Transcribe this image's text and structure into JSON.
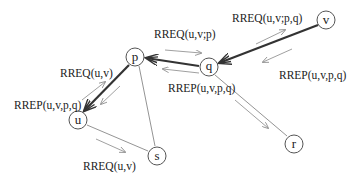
{
  "diagram": {
    "nodes": [
      {
        "id": "p",
        "label": "p",
        "x": 135,
        "y": 57
      },
      {
        "id": "q",
        "label": "q",
        "x": 209,
        "y": 67
      },
      {
        "id": "v",
        "label": "v",
        "x": 326,
        "y": 20
      },
      {
        "id": "u",
        "label": "u",
        "x": 78,
        "y": 120
      },
      {
        "id": "s",
        "label": "s",
        "x": 157,
        "y": 156
      },
      {
        "id": "r",
        "label": "r",
        "x": 294,
        "y": 144
      }
    ],
    "messages": {
      "rreq_vq": "RREQ(u,v;p,q)",
      "rrep_vq": "RREP(u,v,p,q)",
      "rreq_qp": "RREQ(u,v;p)",
      "rrep_qp": "RREP(u,v,p,q)",
      "rreq_pu": "RREQ(u,v)",
      "rrep_pu": "RREP(u,v,p,q)",
      "rreq_us": "RREQ(u,v)"
    },
    "colors": {
      "node_stroke": "#555555",
      "thin_edge": "#888888",
      "thick_edge": "#333333"
    }
  }
}
